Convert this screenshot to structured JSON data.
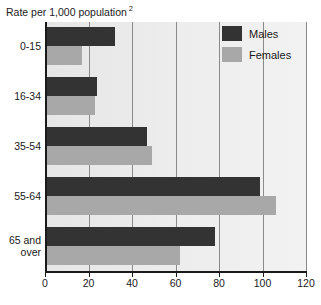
{
  "chart_data": {
    "type": "bar",
    "title": "Rate per 1,000 population",
    "title_superscript": "2",
    "orientation": "horizontal",
    "categories": [
      "0-15",
      "16-34",
      "35-54",
      "55-64",
      "65 and over"
    ],
    "category_lines": [
      [
        "0-15"
      ],
      [
        "16-34"
      ],
      [
        "35-54"
      ],
      [
        "55-64"
      ],
      [
        "65 and",
        "over"
      ]
    ],
    "series": [
      {
        "name": "Males",
        "color": "#333333",
        "values": [
          32,
          24,
          47,
          99,
          78
        ]
      },
      {
        "name": "Females",
        "color": "#a8a8a8",
        "values": [
          17,
          23,
          49,
          106,
          62
        ]
      }
    ],
    "xlabel": "",
    "ylabel": "",
    "xlim": [
      0,
      120
    ],
    "xticks": [
      0,
      20,
      40,
      60,
      80,
      100,
      120
    ],
    "xtick_labels": [
      "0",
      "20",
      "40",
      "60",
      "80",
      "100",
      "120"
    ],
    "grid": true,
    "grid_axis": "x",
    "legend_position": "top-right",
    "legend_entries": [
      "Males",
      "Females"
    ],
    "plot_background": "#ececec"
  }
}
